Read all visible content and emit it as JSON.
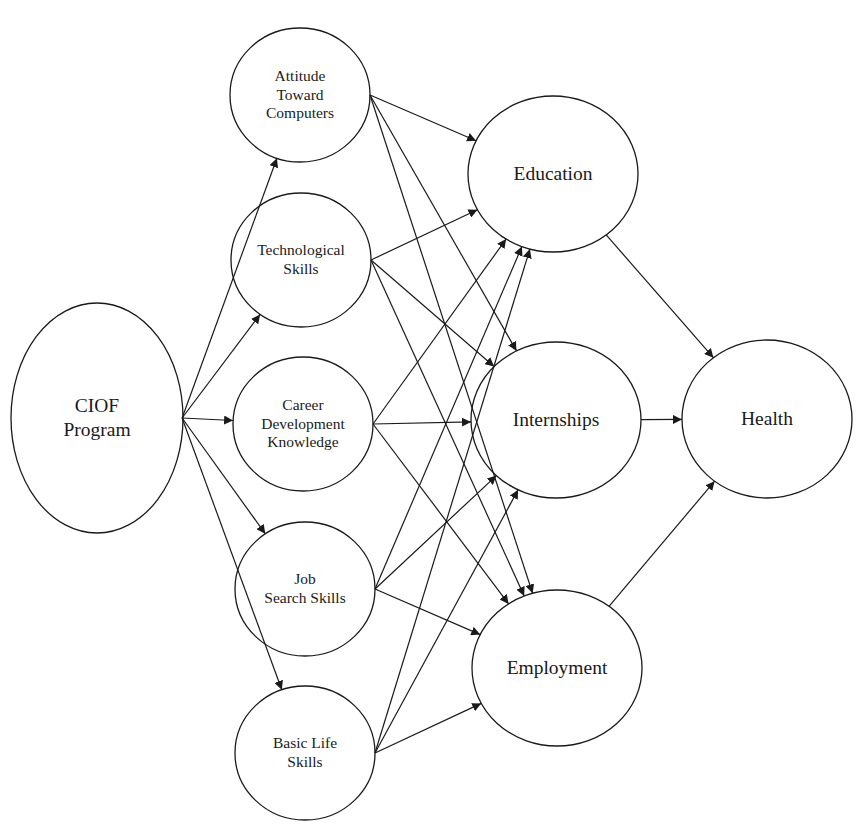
{
  "diagram": {
    "type": "path-model",
    "stroke_color": "#1a1a1a",
    "background": "#ffffff",
    "nodes": [
      {
        "id": "ciof",
        "label": "CIOF\nProgram",
        "cx": 97,
        "cy": 418,
        "rx": 86,
        "ry": 115,
        "size": "large"
      },
      {
        "id": "attitude",
        "label": "Attitude\nToward\nComputers",
        "cx": 300,
        "cy": 95,
        "rx": 70,
        "ry": 67,
        "size": "small"
      },
      {
        "id": "tech",
        "label": "Technological\nSkills",
        "cx": 301,
        "cy": 260,
        "rx": 70,
        "ry": 67,
        "size": "small"
      },
      {
        "id": "career",
        "label": "Career\nDevelopment\nKnowledge",
        "cx": 303,
        "cy": 424,
        "rx": 70,
        "ry": 67,
        "size": "small"
      },
      {
        "id": "job",
        "label": "Job\nSearch Skills",
        "cx": 305,
        "cy": 589,
        "rx": 70,
        "ry": 67,
        "size": "small"
      },
      {
        "id": "basic",
        "label": "Basic Life\nSkills",
        "cx": 305,
        "cy": 753,
        "rx": 70,
        "ry": 67,
        "size": "small"
      },
      {
        "id": "education",
        "label": "Education",
        "cx": 553,
        "cy": 174,
        "rx": 85,
        "ry": 78,
        "size": "large"
      },
      {
        "id": "internships",
        "label": "Internships",
        "cx": 556,
        "cy": 420,
        "rx": 85,
        "ry": 78,
        "size": "large"
      },
      {
        "id": "employment",
        "label": "Employment",
        "cx": 557,
        "cy": 668,
        "rx": 85,
        "ry": 78,
        "size": "large"
      },
      {
        "id": "health",
        "label": "Health",
        "cx": 767,
        "cy": 419,
        "rx": 85,
        "ry": 79,
        "size": "large"
      }
    ],
    "edges": [
      {
        "from": "ciof",
        "to": "attitude"
      },
      {
        "from": "ciof",
        "to": "tech"
      },
      {
        "from": "ciof",
        "to": "career"
      },
      {
        "from": "ciof",
        "to": "job"
      },
      {
        "from": "ciof",
        "to": "basic"
      },
      {
        "from": "attitude",
        "to": "education"
      },
      {
        "from": "attitude",
        "to": "internships"
      },
      {
        "from": "attitude",
        "to": "employment"
      },
      {
        "from": "tech",
        "to": "education"
      },
      {
        "from": "tech",
        "to": "internships"
      },
      {
        "from": "tech",
        "to": "employment"
      },
      {
        "from": "career",
        "to": "education"
      },
      {
        "from": "career",
        "to": "internships"
      },
      {
        "from": "career",
        "to": "employment"
      },
      {
        "from": "job",
        "to": "education"
      },
      {
        "from": "job",
        "to": "internships"
      },
      {
        "from": "job",
        "to": "employment"
      },
      {
        "from": "basic",
        "to": "education"
      },
      {
        "from": "basic",
        "to": "internships"
      },
      {
        "from": "basic",
        "to": "employment"
      },
      {
        "from": "education",
        "to": "health"
      },
      {
        "from": "internships",
        "to": "health"
      },
      {
        "from": "employment",
        "to": "health"
      }
    ]
  }
}
